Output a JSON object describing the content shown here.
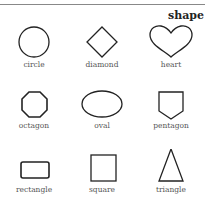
{
  "title": "shape",
  "shapes": [
    {
      "label": "circle",
      "icon": "circle-icon"
    },
    {
      "label": "diamond",
      "icon": "diamond-icon"
    },
    {
      "label": "heart",
      "icon": "heart-icon"
    },
    {
      "label": "octagon",
      "icon": "octagon-icon"
    },
    {
      "label": "oval",
      "icon": "oval-icon"
    },
    {
      "label": "pentagon",
      "icon": "pentagon-icon"
    },
    {
      "label": "rectangle",
      "icon": "rectangle-icon"
    },
    {
      "label": "square",
      "icon": "square-icon"
    },
    {
      "label": "triangle",
      "icon": "triangle-icon"
    }
  ]
}
